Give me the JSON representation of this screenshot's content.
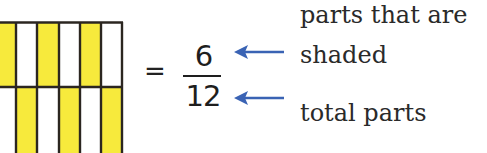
{
  "diagram": {
    "grid": {
      "rows": 2,
      "columns": 6,
      "shaded_color": "#f7ea3c",
      "unshaded_color": "#ffffff",
      "border_color": "#2b2620",
      "cells": [
        [
          "shaded",
          "unshaded",
          "shaded",
          "unshaded",
          "shaded",
          "unshaded"
        ],
        [
          "unshaded",
          "shaded",
          "unshaded",
          "shaded",
          "unshaded",
          "shaded"
        ]
      ]
    },
    "equals_sign": "=",
    "fraction": {
      "numerator": "6",
      "denominator": "12"
    },
    "arrow_color": "#3a63b4",
    "labels": {
      "numerator_line1": "parts that are",
      "numerator_line2": "shaded",
      "denominator": "total parts"
    }
  }
}
